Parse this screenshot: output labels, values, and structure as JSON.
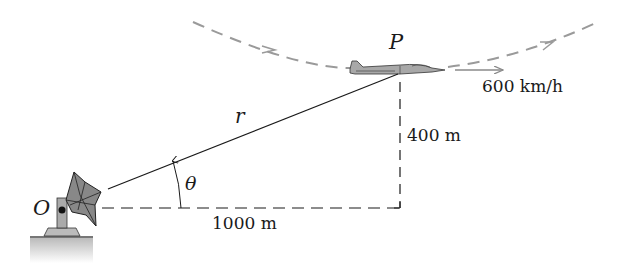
{
  "labels": {
    "point_aircraft": "P",
    "point_origin": "O",
    "range_distance": "r",
    "angle": "θ",
    "vertical_distance": "400 m",
    "horizontal_distance": "1000 m",
    "speed": "600 km/h"
  },
  "colors": {
    "line": "#1a1a1a",
    "dashed_path": "#9a9a9a",
    "aircraft_body": "#a8a8a8",
    "ground": "#c8c8c8"
  }
}
